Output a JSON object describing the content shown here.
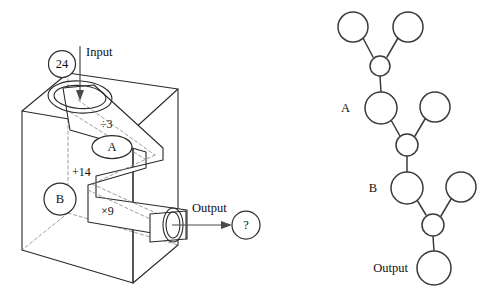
{
  "figure": {
    "left_panel": {
      "name": "function-machine-box",
      "input_value": "24",
      "input_label": "Input",
      "operations": [
        {
          "id": "op1",
          "label": "÷3"
        },
        {
          "id": "op2",
          "label": "+14"
        },
        {
          "id": "op3",
          "label": "×9"
        }
      ],
      "stage_labels": [
        {
          "id": "stage-a",
          "label": "A"
        },
        {
          "id": "stage-b",
          "label": "B"
        }
      ],
      "output_label": "Output",
      "output_value": "?"
    },
    "right_panel": {
      "name": "circle-tree-diagram",
      "labels": [
        {
          "id": "tree-label-a",
          "label": "A"
        },
        {
          "id": "tree-label-b",
          "label": "B"
        },
        {
          "id": "tree-label-output",
          "label": "Output"
        }
      ],
      "nodes": [
        {
          "id": "n-top-left",
          "cx": 353,
          "cy": 27,
          "r": 15,
          "label": ""
        },
        {
          "id": "n-top-right",
          "cx": 408,
          "cy": 27,
          "r": 15,
          "label": ""
        },
        {
          "id": "n-join-1",
          "cx": 380,
          "cy": 66,
          "r": 10,
          "label": ""
        },
        {
          "id": "n-a",
          "cx": 381,
          "cy": 108,
          "r": 16,
          "label": ""
        },
        {
          "id": "n-branch-1",
          "cx": 435,
          "cy": 107,
          "r": 15,
          "label": ""
        },
        {
          "id": "n-join-2",
          "cx": 407,
          "cy": 145,
          "r": 11,
          "label": ""
        },
        {
          "id": "n-b",
          "cx": 407,
          "cy": 188,
          "r": 16,
          "label": ""
        },
        {
          "id": "n-branch-2",
          "cx": 461,
          "cy": 187,
          "r": 15,
          "label": ""
        },
        {
          "id": "n-join-3",
          "cx": 433,
          "cy": 225,
          "r": 11,
          "label": ""
        },
        {
          "id": "n-output",
          "cx": 434,
          "cy": 268,
          "r": 17,
          "label": ""
        }
      ],
      "edges": [
        {
          "from": "n-top-left",
          "to": "n-join-1"
        },
        {
          "from": "n-top-right",
          "to": "n-join-1"
        },
        {
          "from": "n-join-1",
          "to": "n-a"
        },
        {
          "from": "n-a",
          "to": "n-join-2"
        },
        {
          "from": "n-branch-1",
          "to": "n-join-2"
        },
        {
          "from": "n-join-2",
          "to": "n-b"
        },
        {
          "from": "n-b",
          "to": "n-join-3"
        },
        {
          "from": "n-branch-2",
          "to": "n-join-3"
        },
        {
          "from": "n-join-3",
          "to": "n-output"
        }
      ]
    },
    "colors": {
      "stroke": "#2a2a2a",
      "dashed": "#8d8d8d",
      "text": "#111111",
      "background": "#ffffff"
    }
  }
}
